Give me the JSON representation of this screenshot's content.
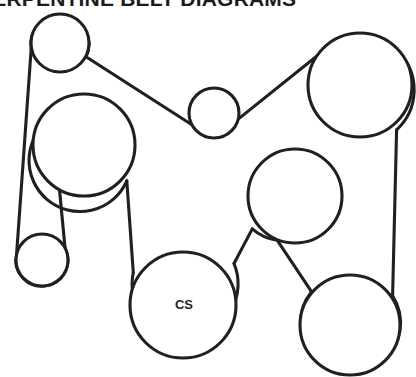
{
  "page": {
    "title": "SERPENTINE BELT DIAGRAMS",
    "background_color": "#ffffff",
    "line_color": "#231f20"
  },
  "diagram": {
    "name": "serpentine-belt-routing-diagram",
    "width": 416,
    "height": 377,
    "pulleys": [
      {
        "id": "top-left-idler",
        "label": "",
        "cx": 60,
        "cy": 43,
        "r": 29
      },
      {
        "id": "left-large-accessory",
        "label": "",
        "cx": 84,
        "cy": 145,
        "r": 51
      },
      {
        "id": "center-small-idler",
        "label": "",
        "cx": 214,
        "cy": 113,
        "r": 25
      },
      {
        "id": "top-right-accessory",
        "label": "",
        "cx": 360,
        "cy": 85,
        "r": 52
      },
      {
        "id": "lower-left-idler",
        "label": "",
        "cx": 42,
        "cy": 260,
        "r": 26
      },
      {
        "id": "mid-right-accessory",
        "label": "",
        "cx": 295,
        "cy": 196,
        "r": 47
      },
      {
        "id": "crankshaft",
        "label": "CS",
        "cx": 183,
        "cy": 305,
        "r": 53
      },
      {
        "id": "bottom-right-accessory",
        "label": "",
        "cx": 350,
        "cy": 325,
        "r": 50
      }
    ],
    "belt_segments": [
      {
        "id": "left-outer-run",
        "from": "top-left-idler",
        "to": "lower-left-idler"
      },
      {
        "id": "top-left-to-center",
        "from": "top-left-idler",
        "to": "center-small-idler"
      },
      {
        "id": "center-to-top-right",
        "from": "center-small-idler",
        "to": "top-right-accessory"
      },
      {
        "id": "right-outer-run",
        "from": "top-right-accessory",
        "to": "bottom-right-accessory"
      },
      {
        "id": "lower-left-to-left-large",
        "from": "lower-left-idler",
        "to": "left-large-accessory"
      },
      {
        "id": "left-large-to-crank",
        "from": "left-large-accessory",
        "to": "crankshaft"
      },
      {
        "id": "crank-to-mid-right",
        "from": "crankshaft",
        "to": "mid-right-accessory"
      },
      {
        "id": "mid-right-to-bottom-right",
        "from": "mid-right-accessory",
        "to": "bottom-right-accessory"
      }
    ]
  }
}
